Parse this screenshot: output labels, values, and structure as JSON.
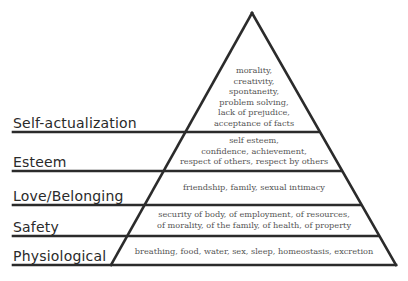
{
  "diagram": {
    "type": "pyramid",
    "levels": [
      {
        "name": "Self-actualization",
        "description_lines": [
          "morality,",
          "creativity,",
          "spontaneity,",
          "problem solving,",
          "lack of prejudice,",
          "acceptance of facts"
        ]
      },
      {
        "name": "Esteem",
        "description_lines": [
          "self esteem,",
          "confidence, achievement,",
          "respect of others, respect by others"
        ]
      },
      {
        "name": "Love/Belonging",
        "description_lines": [
          "friendship, family, sexual intimacy"
        ]
      },
      {
        "name": "Safety",
        "description_lines": [
          "security of body, of employment, of resources,",
          "of morality, of the family, of health, of property"
        ]
      },
      {
        "name": "Physiological",
        "description_lines": [
          "breathing, food, water, sex, sleep, homeostasis, excretion"
        ]
      }
    ],
    "colors": {
      "line": "#2b2b2b",
      "label": "#2a2a2a",
      "description": "#555555"
    }
  }
}
